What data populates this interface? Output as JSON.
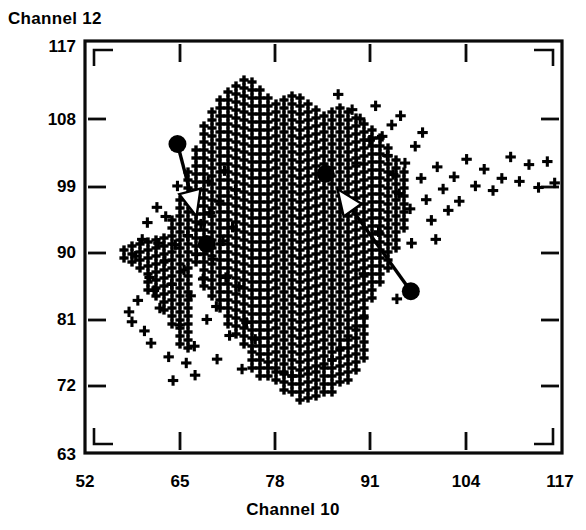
{
  "chart_data": {
    "type": "scatter",
    "title": "",
    "xlabel": "Channel  10",
    "ylabel": "Channel  12",
    "xlim": [
      52,
      117
    ],
    "ylim": [
      63,
      117
    ],
    "xticks": [
      52,
      65,
      78,
      91,
      104,
      117
    ],
    "yticks": [
      63,
      72,
      81,
      90,
      99,
      108,
      117
    ],
    "grid": false,
    "legend": null,
    "marker": "plus",
    "series": [
      {
        "name": "sparse-left",
        "marker": "plus",
        "points": [
          [
            58.0,
            81.5
          ],
          [
            58.4,
            80.2
          ],
          [
            59.2,
            83.0
          ],
          [
            60.1,
            79.0
          ],
          [
            60.8,
            86.0
          ],
          [
            61.4,
            84.3
          ],
          [
            61.0,
            77.4
          ],
          [
            62.2,
            82.0
          ],
          [
            62.9,
            88.2
          ],
          [
            63.4,
            75.6
          ],
          [
            63.8,
            85.1
          ],
          [
            64.3,
            90.3
          ],
          [
            64.9,
            79.8
          ],
          [
            65.5,
            87.0
          ],
          [
            66.0,
            91.5
          ],
          [
            66.4,
            83.6
          ],
          [
            66.9,
            77.0
          ],
          [
            67.2,
            89.0
          ],
          [
            67.8,
            93.0
          ],
          [
            68.1,
            85.8
          ],
          [
            68.6,
            80.5
          ],
          [
            69.0,
            94.5
          ],
          [
            69.4,
            88.4
          ],
          [
            69.9,
            82.2
          ],
          [
            70.3,
            96.0
          ],
          [
            70.8,
            90.8
          ],
          [
            71.2,
            86.0
          ],
          [
            71.7,
            78.4
          ],
          [
            72.1,
            92.6
          ],
          [
            72.5,
            97.5
          ],
          [
            73.0,
            84.8
          ],
          [
            73.4,
            74.0
          ],
          [
            59.8,
            91.0
          ],
          [
            62.0,
            90.5
          ],
          [
            60.5,
            93.2
          ],
          [
            64.0,
            72.5
          ],
          [
            65.8,
            74.8
          ],
          [
            67.0,
            73.2
          ],
          [
            58.9,
            88.8
          ],
          [
            63.0,
            94.0
          ],
          [
            61.8,
            95.2
          ],
          [
            70.0,
            75.3
          ],
          [
            74.0,
            80.1
          ],
          [
            75.2,
            77.9
          ],
          [
            66.2,
            96.8
          ],
          [
            64.6,
            98.0
          ],
          [
            68.8,
            98.6
          ],
          [
            71.0,
            100.0
          ]
        ]
      },
      {
        "name": "sparse-right",
        "marker": "plus",
        "points": [
          [
            92.5,
            104.5
          ],
          [
            93.2,
            102.0
          ],
          [
            94.0,
            99.5
          ],
          [
            94.8,
            97.0
          ],
          [
            95.6,
            101.0
          ],
          [
            96.3,
            95.0
          ],
          [
            97.0,
            103.2
          ],
          [
            97.8,
            99.0
          ],
          [
            98.5,
            96.2
          ],
          [
            99.2,
            93.5
          ],
          [
            100.0,
            100.5
          ],
          [
            100.8,
            97.6
          ],
          [
            101.5,
            94.8
          ],
          [
            102.3,
            99.2
          ],
          [
            103.0,
            96.0
          ],
          [
            104.0,
            101.5
          ],
          [
            105.2,
            98.0
          ],
          [
            106.4,
            100.2
          ],
          [
            107.6,
            97.4
          ],
          [
            108.8,
            99.0
          ],
          [
            110.0,
            101.8
          ],
          [
            111.2,
            98.6
          ],
          [
            112.5,
            100.8
          ],
          [
            113.8,
            97.8
          ],
          [
            115.0,
            101.2
          ],
          [
            116.0,
            98.4
          ],
          [
            93.8,
            106.0
          ],
          [
            95.0,
            107.2
          ],
          [
            98.0,
            105.0
          ],
          [
            89.5,
            106.8
          ],
          [
            90.8,
            104.0
          ],
          [
            91.6,
            108.5
          ],
          [
            88.4,
            108.0
          ],
          [
            92.0,
            92.0
          ],
          [
            90.0,
            86.5
          ],
          [
            94.5,
            83.2
          ],
          [
            96.5,
            90.5
          ],
          [
            99.8,
            91.0
          ],
          [
            86.5,
            110.0
          ],
          [
            89.0,
            101.0
          ]
        ]
      },
      {
        "name": "dense-cluster",
        "marker": "plus",
        "note": "saturated lattice region, 52-91 in Channel 10 and 84-112 in Channel 12"
      }
    ],
    "centroids": [
      {
        "label": "c1",
        "x": 64.6,
        "y": 103.5,
        "r": 9
      },
      {
        "label": "c2",
        "x": 68.6,
        "y": 90.4,
        "r": 9
      },
      {
        "label": "c3",
        "x": 84.8,
        "y": 99.6,
        "r": 9
      },
      {
        "label": "c4",
        "x": 96.4,
        "y": 84.2,
        "r": 9
      }
    ],
    "arrows": [
      {
        "from": "c1",
        "to_x": 67.2,
        "to_y": 94.0
      },
      {
        "from": "c4",
        "to_x": 86.4,
        "to_y": 97.6
      }
    ]
  },
  "labels": {
    "y_axis_title": "Channel  12",
    "x_axis_title": "Channel  10",
    "y_ticks": [
      "117",
      "108",
      "99",
      "90",
      "81",
      "72",
      "63"
    ],
    "x_ticks": [
      "52",
      "65",
      "78",
      "91",
      "104",
      "117"
    ]
  },
  "colors": {
    "ink": "#000000",
    "paper": "#ffffff"
  }
}
